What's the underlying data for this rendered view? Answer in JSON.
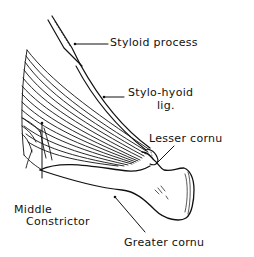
{
  "figure": {
    "line_color": "#111111",
    "background": "#ffffff"
  },
  "labels": {
    "styloid_process": "Styloid process",
    "stylo_hyoid_line1": "Stylo-hyoid",
    "stylo_hyoid_line2": "lig.",
    "lesser_cornu": "Lesser cornu",
    "middle_constrictor_line1": "Middle",
    "middle_constrictor_line2": "Constrictor",
    "greater_cornu": "Greater cornu"
  }
}
